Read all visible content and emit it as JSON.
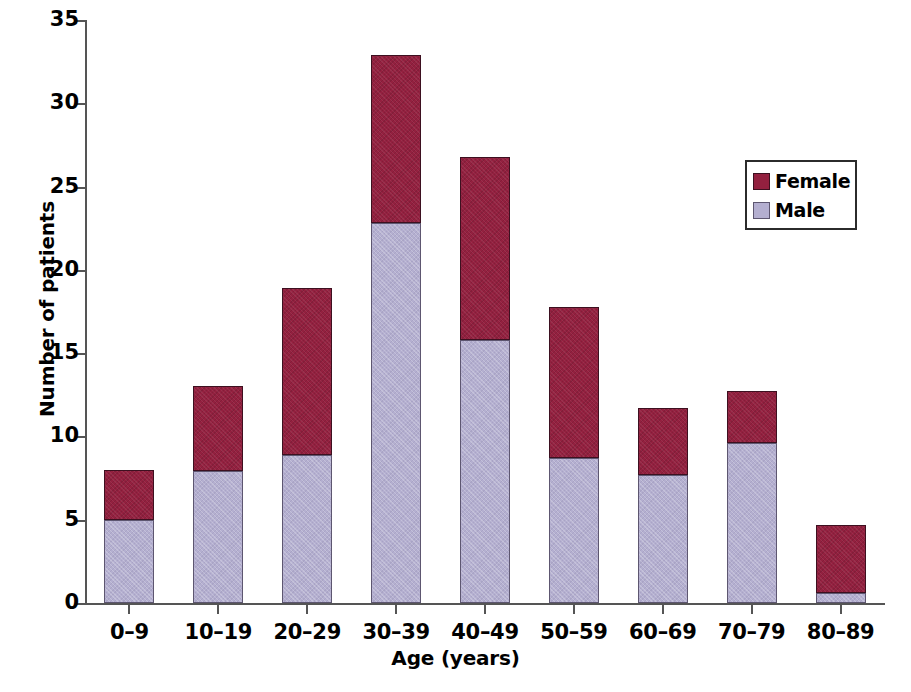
{
  "chart_data": {
    "type": "bar",
    "subtype": "stacked-vertical",
    "title": "",
    "xlabel": "Age (years)",
    "ylabel": "Number of patients",
    "categories": [
      "0–9",
      "10–19",
      "20–29",
      "30–39",
      "40–49",
      "50–59",
      "60–69",
      "70–79",
      "80–89"
    ],
    "series": [
      {
        "name": "Male",
        "color": "#b4afd0",
        "values": [
          5.0,
          7.9,
          8.9,
          22.8,
          15.8,
          8.7,
          7.7,
          9.6,
          0.6
        ]
      },
      {
        "name": "Female",
        "color": "#93203f",
        "values": [
          3.0,
          5.1,
          10.0,
          10.1,
          11.0,
          9.1,
          4.0,
          3.1,
          4.1
        ]
      }
    ],
    "totals": [
      8.0,
      13.0,
      18.9,
      32.9,
      26.8,
      17.8,
      11.7,
      12.7,
      4.7
    ],
    "ylim": [
      0,
      35
    ],
    "yticks": [
      0,
      5,
      10,
      15,
      20,
      25,
      30,
      35
    ],
    "ytick_labels": [
      "0",
      "5",
      "10",
      "15",
      "20",
      "25",
      "30",
      "35"
    ],
    "grid": false,
    "legend_position": "top-right",
    "legend_entries": [
      "Female",
      "Male"
    ]
  },
  "axes": {
    "y_title": "Number of patients",
    "x_title": "Age (years)"
  },
  "legend": {
    "items": [
      {
        "label": "Female",
        "color": "#93203f"
      },
      {
        "label": "Male",
        "color": "#b4afd0"
      }
    ]
  },
  "colors": {
    "female": "#93203f",
    "male": "#b4afd0",
    "axis": "#555555",
    "text": "#000000",
    "background": "#ffffff"
  }
}
